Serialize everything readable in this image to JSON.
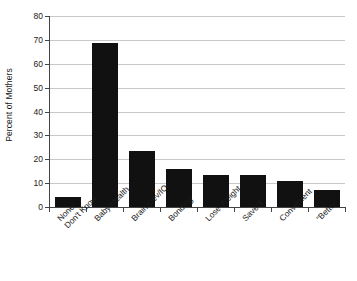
{
  "chart_data": {
    "type": "bar",
    "title": "",
    "xlabel": "",
    "ylabel": "Percent of Mothers",
    "ylim": [
      0,
      80
    ],
    "ytick_values": [
      0,
      10,
      20,
      30,
      40,
      50,
      60,
      70,
      80
    ],
    "ytick_labels": [
      "0",
      "10",
      "20",
      "30",
      "40",
      "50",
      "60",
      "70",
      "80"
    ],
    "grid": true,
    "legend": null,
    "bar_color": "#111111",
    "grid_color": "#c9c9c9",
    "axis_color": "#444444",
    "categories": [
      "None/ Don't Know",
      "Baby Health",
      "Brain Dev/IQ",
      "Bonding",
      "Lose Weight",
      "Save $",
      "Convenient",
      "“Better”"
    ],
    "category_lines": [
      [
        "None/",
        "Don't Know"
      ],
      [
        "Baby Health"
      ],
      [
        "Brain Dev/IQ"
      ],
      [
        "Bonding"
      ],
      [
        "Lose Weight"
      ],
      [
        "Save $"
      ],
      [
        "Convenient"
      ],
      [
        "“Better”"
      ]
    ],
    "values": [
      4,
      68.5,
      23.5,
      16,
      13.5,
      13.5,
      11,
      7
    ]
  }
}
